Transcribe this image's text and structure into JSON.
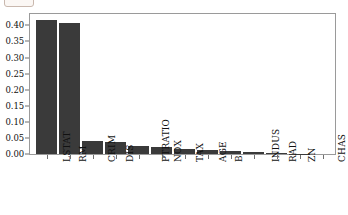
{
  "chart_data": {
    "type": "bar",
    "title": "",
    "xlabel": "",
    "ylabel": "",
    "ylim": [
      0.0,
      0.4385
    ],
    "grid": false,
    "legend": null,
    "bar_color": "#3a3a3a",
    "categories": [
      "LSTAT",
      "RM",
      "CRIM",
      "DIS",
      "PTRATIO",
      "NOX",
      "TAX",
      "AGE",
      "B",
      "INDUS",
      "RAD",
      "ZN",
      "CHAS"
    ],
    "values": [
      0.42,
      0.409,
      0.042,
      0.039,
      0.024,
      0.021,
      0.016,
      0.013,
      0.009,
      0.006,
      0.003,
      0.0005,
      0.0002
    ],
    "ytick_labels": [
      "0.40",
      "0.35",
      "0.30",
      "0.25",
      "0.20",
      "0.15",
      "0.10",
      "0.05",
      "0.00"
    ],
    "ytick_values": [
      0.4,
      0.35,
      0.3,
      0.25,
      0.2,
      0.15,
      0.1,
      0.05,
      0.0
    ]
  }
}
